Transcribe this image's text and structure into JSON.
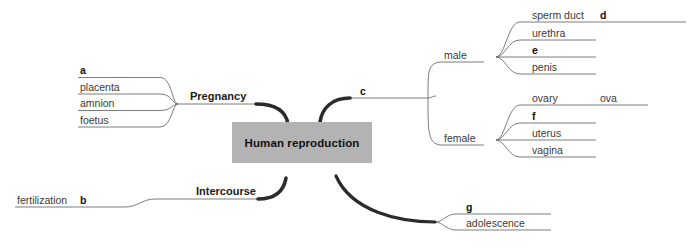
{
  "diagram": {
    "type": "mind-map",
    "title": "Human reproduction",
    "center": {
      "label": "Human reproduction",
      "fill": "#b3b3b3"
    },
    "branches": [
      {
        "id": "pregnancy",
        "label": "Pregnancy",
        "side": "left",
        "children": [
          {
            "id": "a",
            "label": "a",
            "bold": true
          },
          {
            "id": "placenta",
            "label": "placenta",
            "bold": false
          },
          {
            "id": "amnion",
            "label": "amnion",
            "bold": false
          },
          {
            "id": "foetus",
            "label": "foetus",
            "bold": false
          }
        ]
      },
      {
        "id": "intercourse",
        "label": "Intercourse",
        "side": "left",
        "children": [
          {
            "id": "fertilization",
            "label": "fertilization",
            "bold": false
          },
          {
            "id": "b",
            "label": "b",
            "bold": true
          }
        ]
      },
      {
        "id": "c",
        "label": "c",
        "side": "right",
        "children": [
          {
            "id": "male",
            "label": "male",
            "children": [
              {
                "id": "sperm-duct",
                "label": "sperm duct",
                "bold": false
              },
              {
                "id": "d",
                "label": "d",
                "bold": true
              },
              {
                "id": "urethra",
                "label": "urethra",
                "bold": false
              },
              {
                "id": "e",
                "label": "e",
                "bold": true
              },
              {
                "id": "penis",
                "label": "penis",
                "bold": false
              }
            ]
          },
          {
            "id": "female",
            "label": "female",
            "children": [
              {
                "id": "ovary",
                "label": "ovary",
                "bold": false
              },
              {
                "id": "ova",
                "label": "ova",
                "bold": false
              },
              {
                "id": "f",
                "label": "f",
                "bold": true
              },
              {
                "id": "uterus",
                "label": "uterus",
                "bold": false
              },
              {
                "id": "vagina",
                "label": "vagina",
                "bold": false
              }
            ]
          }
        ]
      },
      {
        "id": "adolescence-branch",
        "label": "",
        "side": "right",
        "children": [
          {
            "id": "g",
            "label": "g",
            "bold": true
          },
          {
            "id": "adolescence",
            "label": "adolescence",
            "bold": false
          }
        ]
      }
    ],
    "colors": {
      "wire_thick": "#2b2b2b",
      "wire_thin": "#6e6e6e",
      "text": "#3a3a3a",
      "text_bold": "#111111",
      "center_fill": "#b3b3b3",
      "background": "#ffffff"
    }
  }
}
